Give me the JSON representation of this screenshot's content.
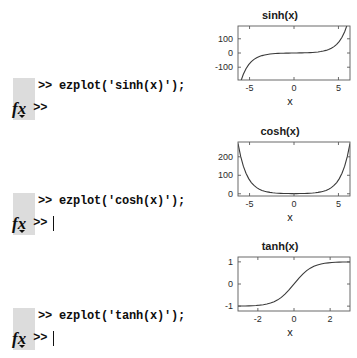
{
  "app": {
    "name": "MATLAB Command Window"
  },
  "console": {
    "entries": [
      {
        "command": ">> ezplot('sinh(x)');",
        "prompt_icon": "fx-icon",
        "prompt": ">>",
        "caret_visible": false
      },
      {
        "command": ">> ezplot('cosh(x)');",
        "prompt_icon": "fx-icon",
        "prompt": ">>",
        "caret_visible": true
      },
      {
        "command": ">> ezplot('tanh(x)');",
        "prompt_icon": "fx-icon",
        "prompt": ">>",
        "caret_visible": true
      }
    ]
  },
  "chart_data": [
    {
      "type": "line",
      "title": "sinh(x)",
      "xlabel": "x",
      "ylabel": "",
      "xlim": [
        -6.3,
        6.3
      ],
      "ylim": [
        -190,
        190
      ],
      "xticks": [
        -5,
        0,
        5
      ],
      "xticklabels": [
        "-5",
        "0",
        "5"
      ],
      "yticks": [
        -100,
        0,
        100
      ],
      "yticklabels": [
        "-100",
        "0",
        "100"
      ],
      "grid": false,
      "legend": null,
      "series": [
        {
          "name": "sinh(x)",
          "x": [
            -6.3,
            -6.0,
            -5.7,
            -5.4,
            -5.1,
            -4.8,
            -4.5,
            -4.2,
            -3.9,
            -3.6,
            -3.3,
            -3.0,
            -2.7,
            -2.4,
            -2.1,
            -1.8,
            -1.5,
            -1.2,
            -0.9,
            -0.6,
            -0.3,
            0,
            0.3,
            0.6,
            0.9,
            1.2,
            1.5,
            1.8,
            2.1,
            2.4,
            2.7,
            3.0,
            3.3,
            3.6,
            3.9,
            4.2,
            4.5,
            4.8,
            5.1,
            5.4,
            5.7,
            6.0,
            6.3
          ],
          "y": [
            -272.3,
            -201.7,
            -149.4,
            -110.7,
            -82.0,
            -60.8,
            -45.0,
            -33.3,
            -24.7,
            -18.3,
            -13.5,
            -10.0,
            -7.4,
            -5.5,
            -4.0,
            -2.9,
            -2.1,
            -1.5,
            -1.0,
            -0.64,
            -0.3,
            0,
            0.3,
            0.64,
            1.0,
            1.5,
            2.1,
            2.9,
            4.0,
            5.5,
            7.4,
            10.0,
            13.5,
            18.3,
            24.7,
            33.3,
            45.0,
            60.8,
            82.0,
            110.7,
            149.4,
            201.7,
            272.3
          ]
        }
      ]
    },
    {
      "type": "line",
      "title": "cosh(x)",
      "xlabel": "x",
      "ylabel": "",
      "xlim": [
        -6.3,
        6.3
      ],
      "ylim": [
        -12,
        280
      ],
      "xticks": [
        -5,
        0,
        5
      ],
      "xticklabels": [
        "-5",
        "0",
        "5"
      ],
      "yticks": [
        0,
        100,
        200
      ],
      "yticklabels": [
        "0",
        "100",
        "200"
      ],
      "grid": false,
      "legend": null,
      "series": [
        {
          "name": "cosh(x)",
          "x": [
            -6.3,
            -6.0,
            -5.7,
            -5.4,
            -5.1,
            -4.8,
            -4.5,
            -4.2,
            -3.9,
            -3.6,
            -3.3,
            -3.0,
            -2.7,
            -2.4,
            -2.1,
            -1.8,
            -1.5,
            -1.2,
            -0.9,
            -0.6,
            -0.3,
            0,
            0.3,
            0.6,
            0.9,
            1.2,
            1.5,
            1.8,
            2.1,
            2.4,
            2.7,
            3.0,
            3.3,
            3.6,
            3.9,
            4.2,
            4.5,
            4.8,
            5.1,
            5.4,
            5.7,
            6.0,
            6.3
          ],
          "y": [
            272.3,
            201.7,
            149.4,
            110.7,
            82.0,
            60.8,
            45.0,
            33.4,
            24.7,
            18.3,
            13.6,
            10.1,
            7.5,
            5.6,
            4.1,
            3.1,
            2.4,
            1.8,
            1.4,
            1.19,
            1.05,
            1.0,
            1.05,
            1.19,
            1.4,
            1.8,
            2.4,
            3.1,
            4.1,
            5.6,
            7.5,
            10.1,
            13.6,
            18.3,
            24.7,
            33.4,
            45.0,
            60.8,
            82.0,
            110.7,
            149.4,
            201.7,
            272.3
          ]
        }
      ]
    },
    {
      "type": "line",
      "title": "tanh(x)",
      "xlabel": "x",
      "ylabel": "",
      "xlim": [
        -3.1,
        3.1
      ],
      "ylim": [
        -1.22,
        1.22
      ],
      "xticks": [
        -2,
        0,
        2
      ],
      "xticklabels": [
        "-2",
        "0",
        "2"
      ],
      "yticks": [
        -1,
        0,
        1
      ],
      "yticklabels": [
        "-1",
        "0",
        "1"
      ],
      "grid": false,
      "legend": null,
      "series": [
        {
          "name": "tanh(x)",
          "x": [
            -3.1,
            -2.9,
            -2.7,
            -2.5,
            -2.3,
            -2.1,
            -1.9,
            -1.7,
            -1.5,
            -1.3,
            -1.1,
            -0.9,
            -0.7,
            -0.5,
            -0.3,
            -0.1,
            0.1,
            0.3,
            0.5,
            0.7,
            0.9,
            1.1,
            1.3,
            1.5,
            1.7,
            1.9,
            2.1,
            2.3,
            2.5,
            2.7,
            2.9,
            3.1
          ],
          "y": [
            -0.996,
            -0.994,
            -0.991,
            -0.987,
            -0.98,
            -0.97,
            -0.956,
            -0.935,
            -0.905,
            -0.862,
            -0.8,
            -0.716,
            -0.604,
            -0.462,
            -0.291,
            -0.1,
            0.1,
            0.291,
            0.462,
            0.604,
            0.716,
            0.8,
            0.862,
            0.905,
            0.935,
            0.956,
            0.97,
            0.98,
            0.987,
            0.991,
            0.994,
            0.996
          ]
        }
      ]
    }
  ],
  "layout": {
    "figure_tops": [
      8,
      124,
      239
    ],
    "console_tops": [
      78,
      193,
      308
    ]
  },
  "colors": {
    "background": "#ffffff",
    "text": "#111111",
    "gutter": "#dcdcdc",
    "axis": "#5a5a5a",
    "curve": "#3a3a3a"
  }
}
